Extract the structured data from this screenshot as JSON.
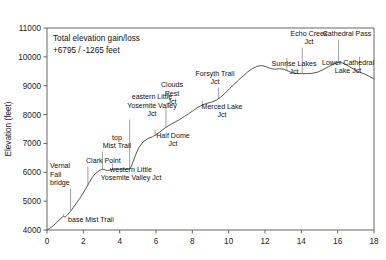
{
  "chart_data": {
    "type": "line",
    "title": "",
    "xlabel": "",
    "ylabel": "Elevation (feet)",
    "xlim": [
      0,
      18
    ],
    "ylim": [
      4000,
      11000
    ],
    "xticks": [
      0,
      2,
      4,
      6,
      8,
      10,
      12,
      14,
      16,
      18
    ],
    "yticks": [
      4000,
      5000,
      6000,
      7000,
      8000,
      9000,
      10000,
      11000
    ],
    "grid": false,
    "legend": null,
    "annotations": [
      "Total elevation gain/loss",
      "+6795 / -1265 feet"
    ],
    "series": [
      {
        "name": "Elevation profile",
        "x": [
          0.0,
          0.15,
          0.35,
          0.55,
          0.75,
          0.9,
          1.0,
          1.12,
          1.28,
          1.45,
          1.62,
          1.8,
          1.98,
          2.15,
          2.32,
          2.5,
          2.65,
          2.78,
          2.88,
          2.98,
          3.08,
          3.2,
          3.32,
          3.45,
          3.58,
          3.7,
          3.85,
          4.0,
          4.2,
          4.4,
          4.58,
          4.7,
          4.85,
          5.05,
          5.3,
          5.55,
          5.8,
          6.05,
          6.3,
          6.55,
          6.8,
          7.05,
          7.3,
          7.55,
          7.8,
          8.05,
          8.3,
          8.55,
          8.8,
          9.05,
          9.3,
          9.55,
          9.8,
          10.05,
          10.3,
          10.55,
          10.8,
          11.05,
          11.3,
          11.55,
          11.8,
          12.05,
          12.3,
          12.55,
          12.8,
          13.05,
          13.3,
          13.55,
          13.8,
          14.05,
          14.3,
          14.6,
          14.9,
          15.2,
          15.5,
          15.8,
          16.05,
          16.25,
          16.5,
          16.75,
          17.0,
          17.25,
          17.5,
          17.75,
          18.0
        ],
        "y": [
          4000,
          4060,
          4150,
          4270,
          4400,
          4470,
          4450,
          4520,
          4640,
          4780,
          4930,
          5090,
          5270,
          5450,
          5640,
          5830,
          5950,
          6010,
          6060,
          6090,
          6105,
          6085,
          6060,
          6075,
          6100,
          6115,
          6110,
          6105,
          6110,
          6115,
          6120,
          6300,
          6560,
          6850,
          7060,
          7170,
          7230,
          7320,
          7440,
          7560,
          7660,
          7740,
          7830,
          7930,
          8030,
          8140,
          8250,
          8330,
          8390,
          8430,
          8490,
          8600,
          8740,
          8900,
          9050,
          9200,
          9340,
          9480,
          9590,
          9670,
          9700,
          9660,
          9600,
          9570,
          9590,
          9570,
          9500,
          9440,
          9420,
          9420,
          9420,
          9430,
          9470,
          9560,
          9660,
          9760,
          9800,
          9790,
          9720,
          9620,
          9530,
          9460,
          9400,
          9320,
          9230
        ]
      }
    ],
    "waypoints": [
      {
        "name": "base Mist Trail",
        "mile": 0.9,
        "elev": 4470,
        "label": "base Mist Trail",
        "lx": 68,
        "ly": 222,
        "anchor": "start",
        "lines": [
          "base Mist Trail"
        ]
      },
      {
        "name": "Vernal Fall bridge",
        "mile": 1.3,
        "elev": 4660,
        "label": "Vernal Fall bridge",
        "lx": 50,
        "ly": 185,
        "anchor": "start",
        "lines": [
          "Vernal",
          "Fall",
          "bridge"
        ]
      },
      {
        "name": "Clark Point",
        "mile": 2.25,
        "elev": 5530,
        "label": "Clark Point",
        "lx": 86,
        "ly": 163,
        "anchor": "start",
        "lines": [
          "Clark Point"
        ]
      },
      {
        "name": "top Mist Trail",
        "mile": 3.05,
        "elev": 6105,
        "label": "top Mist Trail",
        "lx": 117,
        "ly": 148,
        "anchor": "middle",
        "lines": [
          "top",
          "Mist Trail"
        ]
      },
      {
        "name": "western Little Yosemite Valley Jct",
        "mile": 3.6,
        "elev": 6100,
        "label": "western Little Yosemite Valley Jct",
        "lx": 131,
        "ly": 180,
        "anchor": "middle",
        "lines": [
          "western Little",
          "Yosemite Valley Jct"
        ]
      },
      {
        "name": "eastern Little Yosemite Valley Jct",
        "mile": 4.55,
        "elev": 6118,
        "label": "eastern Little Yosemite Valley Jct",
        "lx": 152,
        "ly": 116,
        "anchor": "middle",
        "lines": [
          "eastern Little",
          "Yosemite Valley",
          "Jct"
        ]
      },
      {
        "name": "Half Dome Jct",
        "mile": 5.95,
        "elev": 7260,
        "label": "Half Dome Jct",
        "lx": 173,
        "ly": 146,
        "anchor": "middle",
        "lines": [
          "Half Dome",
          "Jct"
        ]
      },
      {
        "name": "Clouds Rest Jct",
        "mile": 6.55,
        "elev": 7560,
        "label": "Clouds Rest Jct",
        "lx": 172,
        "ly": 104,
        "anchor": "middle",
        "lines": [
          "Clouds",
          "Rest",
          "Jct"
        ]
      },
      {
        "name": "Merced Lake Jct",
        "mile": 8.55,
        "elev": 8330,
        "label": "Merced Lake Jct",
        "lx": 222,
        "ly": 117,
        "anchor": "middle",
        "lines": [
          "Merced Lake",
          "Jct"
        ]
      },
      {
        "name": "Forsyth Trail Jct",
        "mile": 9.45,
        "elev": 8560,
        "label": "Forsyth Trail Jct",
        "lx": 215,
        "ly": 84,
        "anchor": "middle",
        "lines": [
          "Forsyth Trail",
          "Jct"
        ]
      },
      {
        "name": "Sunrise Lakes Jct",
        "mile": 13.2,
        "elev": 9520,
        "label": "Sunrise Lakes Jct",
        "lx": 294,
        "ly": 74,
        "anchor": "middle",
        "lines": [
          "Sunrise Lakes",
          "Jct"
        ]
      },
      {
        "name": "Echo Creek Jct",
        "mile": 14.05,
        "elev": 9420,
        "label": "Echo Creek Jct",
        "lx": 309,
        "ly": 44,
        "anchor": "middle",
        "lines": [
          "Echo Creek",
          "Jct"
        ]
      },
      {
        "name": "Cathedral Pass",
        "mile": 16.05,
        "elev": 9800,
        "label": "Cathedral Pass",
        "lx": 347,
        "ly": 36,
        "anchor": "middle",
        "lines": [
          "Cathedral Pass"
        ]
      },
      {
        "name": "Lower Cathedral Lake Jct",
        "mile": 17.2,
        "elev": 9530,
        "label": "Lower Cathedral Lake Jct",
        "lx": 348,
        "ly": 73,
        "anchor": "middle",
        "lines": [
          "Lower Cathedral",
          "Lake Jct"
        ]
      }
    ]
  },
  "plot": {
    "left": 47,
    "right": 374,
    "top": 28,
    "bottom": 230
  }
}
